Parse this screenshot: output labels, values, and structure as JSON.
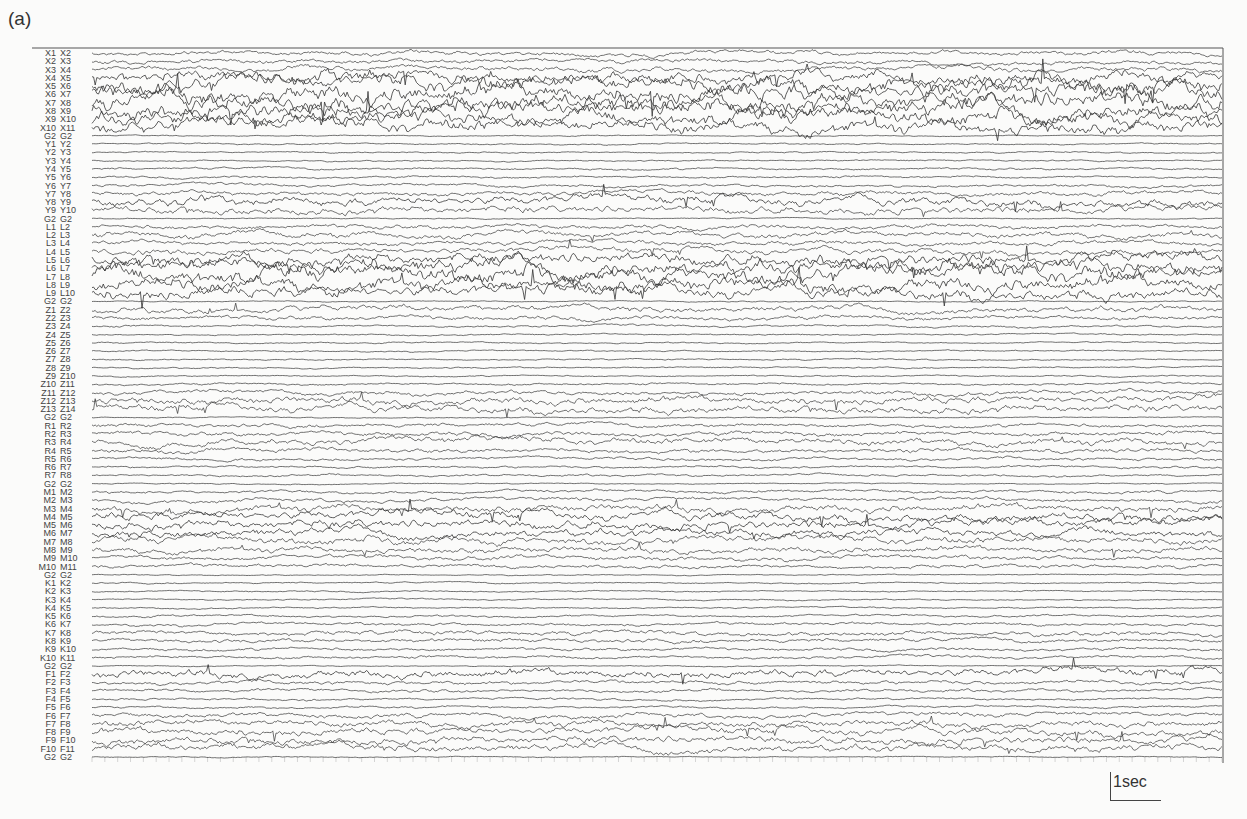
{
  "figure": {
    "panel_label": "(a)",
    "scale_bar_label": "1sec"
  },
  "chart_data": {
    "type": "line",
    "title": "(a)",
    "xlabel": "",
    "ylabel": "",
    "x_unit": "sec",
    "duration_sec": 22,
    "scale_bar": {
      "value": 1,
      "unit": "sec",
      "label": "1sec"
    },
    "grid": "vertical ticks each second",
    "channels": [
      {
        "label": "X1 X2",
        "amp": 0.6
      },
      {
        "label": "X2 X3",
        "amp": 0.6
      },
      {
        "label": "X3 X4",
        "amp": 0.7
      },
      {
        "label": "X4 X5",
        "amp": 1.6
      },
      {
        "label": "X5 X6",
        "amp": 2.2
      },
      {
        "label": "X6 X7",
        "amp": 2.4
      },
      {
        "label": "X7 X8",
        "amp": 2.4
      },
      {
        "label": "X8 X9",
        "amp": 2.2
      },
      {
        "label": "X9 X10",
        "amp": 2.0
      },
      {
        "label": "X10 X11",
        "amp": 1.8
      },
      {
        "label": "G2 G2",
        "amp": 0.15
      },
      {
        "label": "Y1 Y2",
        "amp": 0.2
      },
      {
        "label": "Y2 Y3",
        "amp": 0.2
      },
      {
        "label": "Y3 Y4",
        "amp": 0.2
      },
      {
        "label": "Y4 Y5",
        "amp": 0.3
      },
      {
        "label": "Y5 Y6",
        "amp": 0.3
      },
      {
        "label": "Y6 Y7",
        "amp": 0.4
      },
      {
        "label": "Y7 Y8",
        "amp": 0.6
      },
      {
        "label": "Y8 Y9",
        "amp": 1.2
      },
      {
        "label": "Y9 Y10",
        "amp": 1.0
      },
      {
        "label": "G2 G2",
        "amp": 0.15
      },
      {
        "label": "L1 L2",
        "amp": 0.6
      },
      {
        "label": "L2 L3",
        "amp": 0.8
      },
      {
        "label": "L3 L4",
        "amp": 0.6
      },
      {
        "label": "L4 L5",
        "amp": 0.8
      },
      {
        "label": "L5 L6",
        "amp": 1.6
      },
      {
        "label": "L6 L7",
        "amp": 2.0
      },
      {
        "label": "L7 L8",
        "amp": 2.2
      },
      {
        "label": "L8 L9",
        "amp": 2.0
      },
      {
        "label": "L9 L10",
        "amp": 1.6
      },
      {
        "label": "G2 G2",
        "amp": 0.15
      },
      {
        "label": "Z1 Z2",
        "amp": 0.8
      },
      {
        "label": "Z2 Z3",
        "amp": 0.6
      },
      {
        "label": "Z3 Z4",
        "amp": 0.3
      },
      {
        "label": "Z4 Z5",
        "amp": 0.2
      },
      {
        "label": "Z5 Z6",
        "amp": 0.2
      },
      {
        "label": "Z6 Z7",
        "amp": 0.2
      },
      {
        "label": "Z7 Z8",
        "amp": 0.2
      },
      {
        "label": "Z8 Z9",
        "amp": 0.2
      },
      {
        "label": "Z9 Z10",
        "amp": 0.2
      },
      {
        "label": "Z10 Z11",
        "amp": 0.3
      },
      {
        "label": "Z11 Z12",
        "amp": 0.6
      },
      {
        "label": "Z12 Z13",
        "amp": 1.0
      },
      {
        "label": "Z13 Z14",
        "amp": 1.0
      },
      {
        "label": "G2 G2",
        "amp": 0.15
      },
      {
        "label": "R1 R2",
        "amp": 0.5
      },
      {
        "label": "R2 R3",
        "amp": 0.6
      },
      {
        "label": "R3 R4",
        "amp": 0.9
      },
      {
        "label": "R4 R5",
        "amp": 0.6
      },
      {
        "label": "R5 R6",
        "amp": 0.4
      },
      {
        "label": "R6 R7",
        "amp": 0.3
      },
      {
        "label": "R7 R8",
        "amp": 0.3
      },
      {
        "label": "G2 G2",
        "amp": 0.15
      },
      {
        "label": "M1 M2",
        "amp": 0.4
      },
      {
        "label": "M2 M3",
        "amp": 0.5
      },
      {
        "label": "M3 M4",
        "amp": 1.0
      },
      {
        "label": "M4 M5",
        "amp": 1.2
      },
      {
        "label": "M5 M6",
        "amp": 1.2
      },
      {
        "label": "M6 M7",
        "amp": 1.1
      },
      {
        "label": "M7 M8",
        "amp": 1.0
      },
      {
        "label": "M8 M9",
        "amp": 0.8
      },
      {
        "label": "M9 M10",
        "amp": 0.6
      },
      {
        "label": "M10 M11",
        "amp": 0.5
      },
      {
        "label": "G2 G2",
        "amp": 0.15
      },
      {
        "label": "K1 K2",
        "amp": 0.2
      },
      {
        "label": "K2 K3",
        "amp": 0.2
      },
      {
        "label": "K3 K4",
        "amp": 0.2
      },
      {
        "label": "K4 K5",
        "amp": 0.2
      },
      {
        "label": "K5 K6",
        "amp": 0.3
      },
      {
        "label": "K6 K7",
        "amp": 0.4
      },
      {
        "label": "K7 K8",
        "amp": 0.6
      },
      {
        "label": "K8 K9",
        "amp": 0.5
      },
      {
        "label": "K9 K10",
        "amp": 0.4
      },
      {
        "label": "K10 K11",
        "amp": 0.4
      },
      {
        "label": "G2 G2",
        "amp": 0.15
      },
      {
        "label": "F1 F2",
        "amp": 1.1
      },
      {
        "label": "F2 F3",
        "amp": 0.5
      },
      {
        "label": "F3 F4",
        "amp": 0.4
      },
      {
        "label": "F4 F5",
        "amp": 0.3
      },
      {
        "label": "F5 F6",
        "amp": 0.3
      },
      {
        "label": "F6 F7",
        "amp": 0.6
      },
      {
        "label": "F7 F8",
        "amp": 0.9
      },
      {
        "label": "F8 F9",
        "amp": 1.0
      },
      {
        "label": "F9 F10",
        "amp": 1.0
      },
      {
        "label": "F10 F11",
        "amp": 1.0
      },
      {
        "label": "G2 G2",
        "amp": 0.15
      }
    ]
  }
}
